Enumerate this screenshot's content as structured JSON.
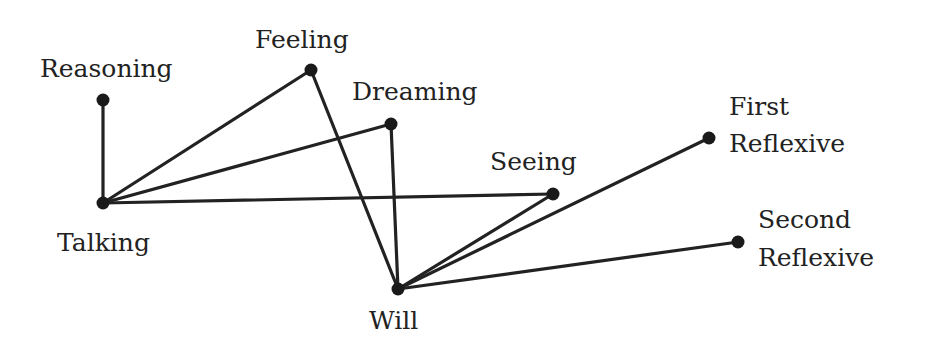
{
  "diagram": {
    "type": "graph",
    "nodes": [
      {
        "id": "reasoning",
        "label": "Reasoning",
        "x": 103,
        "y": 100,
        "lx": 40,
        "ly": 54,
        "lines": [
          "Reasoning"
        ]
      },
      {
        "id": "talking",
        "label": "Talking",
        "x": 103,
        "y": 203,
        "lx": 57,
        "ly": 228,
        "lines": [
          "Talking"
        ]
      },
      {
        "id": "feeling",
        "label": "Feeling",
        "x": 311,
        "y": 70,
        "lx": 255,
        "ly": 25,
        "lines": [
          "Feeling"
        ]
      },
      {
        "id": "dreaming",
        "label": "Dreaming",
        "x": 391,
        "y": 124,
        "lx": 352,
        "ly": 77,
        "lines": [
          "Dreaming"
        ]
      },
      {
        "id": "seeing",
        "label": "Seeing",
        "x": 553,
        "y": 194,
        "lx": 490,
        "ly": 147,
        "lines": [
          "Seeing"
        ]
      },
      {
        "id": "will",
        "label": "Will",
        "x": 398,
        "y": 289,
        "lx": 369,
        "ly": 306,
        "lines": [
          "Will"
        ]
      },
      {
        "id": "first-reflexive",
        "label": "First Reflexive",
        "x": 709,
        "y": 138,
        "lx": 729,
        "ly": 92,
        "lines": [
          "First",
          "Reflexive"
        ]
      },
      {
        "id": "second-reflexive",
        "label": "Second Reflexive",
        "x": 738,
        "y": 242,
        "lx": 758,
        "ly": 205,
        "lines": [
          "Second",
          "Reflexive"
        ]
      }
    ],
    "edges": [
      [
        "reasoning",
        "talking"
      ],
      [
        "talking",
        "feeling"
      ],
      [
        "talking",
        "dreaming"
      ],
      [
        "talking",
        "seeing"
      ],
      [
        "feeling",
        "will"
      ],
      [
        "dreaming",
        "will"
      ],
      [
        "seeing",
        "will"
      ],
      [
        "first-reflexive",
        "will"
      ],
      [
        "second-reflexive",
        "will"
      ]
    ],
    "colors": {
      "line": "#222222",
      "node": "#1a1a1a",
      "text": "#222222",
      "background": "#ffffff"
    }
  },
  "labels": {
    "reasoning": "Reasoning",
    "talking": "Talking",
    "feeling": "Feeling",
    "dreaming": "Dreaming",
    "seeing": "Seeing",
    "will": "Will",
    "first_reflexive_1": "First",
    "first_reflexive_2": "Reflexive",
    "second_reflexive_1": "Second",
    "second_reflexive_2": "Reflexive"
  }
}
